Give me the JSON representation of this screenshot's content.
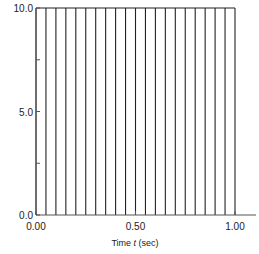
{
  "chart_data": {
    "type": "bar",
    "title": "",
    "xlabel": "Time t (sec)",
    "ylabel": "",
    "xlim": [
      0.0,
      1.0
    ],
    "ylim": [
      0.0,
      10.0
    ],
    "grid": false,
    "x": [
      0.0,
      0.05,
      0.1,
      0.15,
      0.2,
      0.25,
      0.3,
      0.35,
      0.4,
      0.45,
      0.5,
      0.55,
      0.6,
      0.65,
      0.7,
      0.75,
      0.8,
      0.85,
      0.9,
      0.95,
      1.0
    ],
    "values": [
      10,
      10,
      10,
      10,
      10,
      10,
      10,
      10,
      10,
      10,
      10,
      10,
      10,
      10,
      10,
      10,
      10,
      10,
      10,
      10,
      10
    ],
    "x_ticks": [
      {
        "value": 0.0,
        "label": "0.00"
      },
      {
        "value": 0.5,
        "label": "0.50"
      },
      {
        "value": 1.0,
        "label": "1.00"
      }
    ],
    "y_ticks": [
      {
        "value": 0.0,
        "label": "0.0"
      },
      {
        "value": 2.5,
        "label": ""
      },
      {
        "value": 5.0,
        "label": "5.0"
      },
      {
        "value": 7.5,
        "label": ""
      },
      {
        "value": 10.0,
        "label": "10.0"
      }
    ],
    "colors": {
      "line": "#222222",
      "axis": "#555555"
    }
  },
  "labels": {
    "xlabel_prefix": "Time ",
    "xlabel_var": "t",
    "xlabel_suffix": " (sec)"
  }
}
